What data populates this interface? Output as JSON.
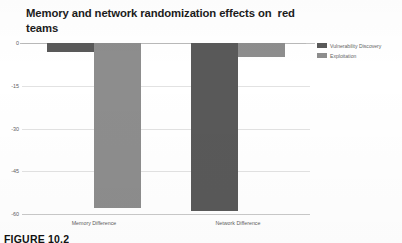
{
  "figure": {
    "caption": "FIGURE 10.2"
  },
  "chart_data": {
    "type": "bar",
    "title": "Memory and network randomization effects on  red\nteams",
    "xlabel": "",
    "ylabel": "",
    "categories": [
      "Memory Difference",
      "Network Difference"
    ],
    "series": [
      {
        "name": "Vulnerability Discovery",
        "color": "#595959",
        "values": [
          -3,
          -59
        ]
      },
      {
        "name": "Exploitation",
        "color": "#8d8d8d",
        "values": [
          -58,
          -5
        ]
      }
    ],
    "ylim": [
      -60,
      0
    ],
    "yticks": [
      0,
      -15,
      -30,
      -45,
      -60
    ],
    "ytick_labels": [
      "0",
      "-15",
      "-30",
      "-45",
      "-60"
    ],
    "grid": true,
    "legend_position": "right",
    "orientation": "vertical",
    "bar_direction": "downward"
  }
}
